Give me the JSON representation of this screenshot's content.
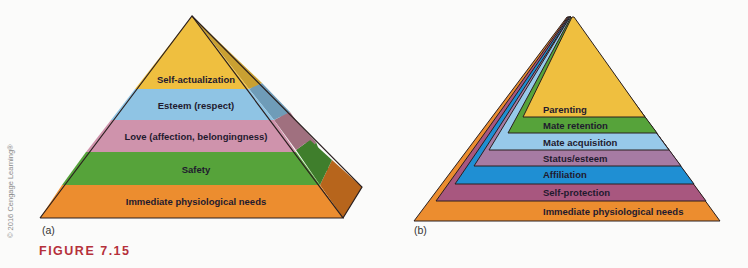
{
  "figure": {
    "label": "FIGURE 7.15"
  },
  "copyright": "© 2016 Cengage Learning®",
  "panel_a": {
    "label": "(a)",
    "levels": [
      {
        "name": "Self-actualization",
        "color": "#efbf3f"
      },
      {
        "name": "Esteem (respect)",
        "color": "#8fc4e4"
      },
      {
        "name": "Love (affection, belongingness)",
        "color": "#cf93ac"
      },
      {
        "name": "Safety",
        "color": "#56a33a"
      },
      {
        "name": "Immediate physiological needs",
        "color": "#ec8d2f"
      }
    ]
  },
  "panel_b": {
    "label": "(b)",
    "levels": [
      {
        "name": "Parenting",
        "color": "#efbf3f"
      },
      {
        "name": "Mate retention",
        "color": "#56a33a"
      },
      {
        "name": "Mate acquisition",
        "color": "#97c9ea"
      },
      {
        "name": "Status/esteem",
        "color": "#a67ba3"
      },
      {
        "name": "Affiliation",
        "color": "#1f8fd3"
      },
      {
        "name": "Self-protection",
        "color": "#a8577f"
      },
      {
        "name": "Immediate physiological needs",
        "color": "#ec8d2f"
      }
    ]
  }
}
